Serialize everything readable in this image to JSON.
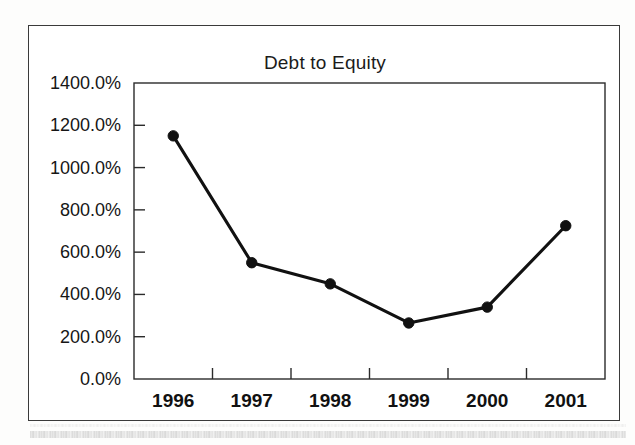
{
  "document": {
    "type": "scanned-figure",
    "background_color": "#ffffff",
    "frame_color": "#3a3a3a"
  },
  "chart_data": {
    "type": "line",
    "title": "Debt to Equity",
    "xlabel": "",
    "ylabel": "",
    "categories": [
      "1996",
      "1997",
      "1998",
      "1999",
      "2000",
      "2001"
    ],
    "values": [
      1150,
      550,
      450,
      265,
      340,
      725
    ],
    "value_labels": [
      "1150.0%",
      "550.0%",
      "450.0%",
      "265.0%",
      "340.0%",
      "725.0%"
    ],
    "series": [
      {
        "name": "Debt to Equity",
        "values": [
          1150,
          550,
          450,
          265,
          340,
          725
        ],
        "line_color": "#111111",
        "marker": "circle",
        "marker_color": "#111111"
      }
    ],
    "ylim": [
      0,
      1400
    ],
    "ytick_values": [
      1400,
      1200,
      1000,
      800,
      600,
      400,
      200,
      0
    ],
    "ytick_labels": [
      "1400.0%",
      "1200.0%",
      "1000.0%",
      "800.0%",
      "600.0%",
      "400.0%",
      "200.0%",
      "0.0%"
    ],
    "grid": false,
    "legend": false,
    "legend_position": "none",
    "units": "percent",
    "axis_color": "#2b2b2b"
  },
  "plot_geometry": {
    "left": 105,
    "right": 576,
    "top": 57,
    "bottom": 353
  }
}
